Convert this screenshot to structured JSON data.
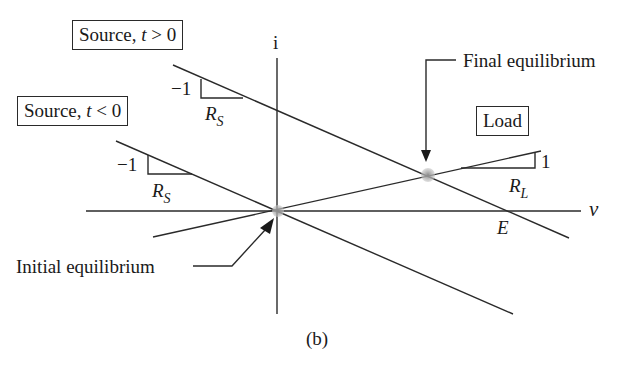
{
  "figure": {
    "caption": "(b)",
    "axes": {
      "y_label": "i",
      "x_label": "v"
    },
    "labels": {
      "source_after": {
        "prefix": "Source, ",
        "var": "t",
        "rel": " > 0"
      },
      "source_before": {
        "prefix": "Source, ",
        "var": "t",
        "rel": " < 0"
      },
      "load": "Load",
      "final_equilibrium": "Final equilibrium",
      "initial_equilibrium": "Initial equilibrium",
      "intercept": "E"
    },
    "slope_markers": {
      "source_after": {
        "rise": "−1",
        "run_main": "R",
        "run_sub": "S"
      },
      "source_before": {
        "rise": "−1",
        "run_main": "R",
        "run_sub": "S"
      },
      "load": {
        "rise": "1",
        "run_main": "R",
        "run_sub": "L"
      }
    },
    "colors": {
      "line": "#2a2a2a",
      "point": "#a8a8a8"
    }
  }
}
